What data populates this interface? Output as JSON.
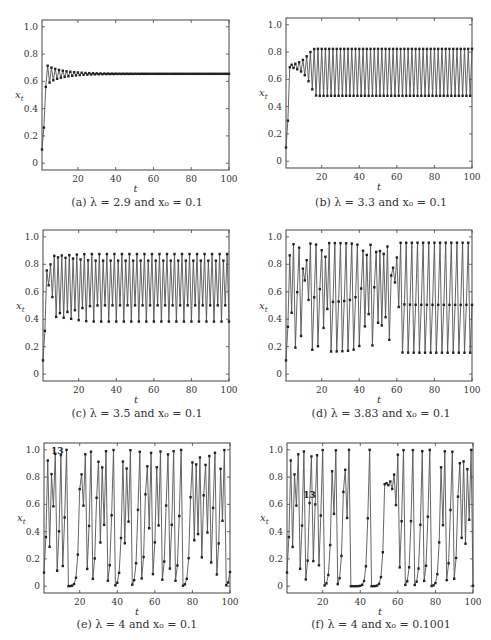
{
  "figure": {
    "panels": [
      {
        "id": "a",
        "caption": "(a) λ = 2.9 and x₀ = 0.1",
        "lambda": 2.9,
        "x0": 0.1,
        "annotation": null
      },
      {
        "id": "b",
        "caption": "(b) λ = 3.3 and x₀ = 0.1",
        "lambda": 3.3,
        "x0": 0.1,
        "annotation": null
      },
      {
        "id": "c",
        "caption": "(c) λ = 3.5 and x₀ = 0.1",
        "lambda": 3.5,
        "x0": 0.1,
        "annotation": null
      },
      {
        "id": "d",
        "caption": "(d) λ = 3.83 and x₀ = 0.1",
        "lambda": 3.83,
        "x0": 0.1,
        "annotation": null
      },
      {
        "id": "e",
        "caption": "(e) λ = 4 and x₀ = 0.1",
        "lambda": 4,
        "x0": 0.1,
        "annotation": {
          "text": "13",
          "t": 13,
          "position": "below-left"
        }
      },
      {
        "id": "f",
        "caption": "(f) λ = 4 and x₀ = 0.1001",
        "lambda": 4,
        "x0": 0.1001,
        "annotation": {
          "text": "13",
          "t": 13,
          "position": "above"
        }
      }
    ],
    "xlabel": "t",
    "ylabel": "x_t",
    "xticks": [
      "20",
      "40",
      "60",
      "80",
      "100"
    ],
    "yticks": [
      "0",
      "0.2",
      "0.4",
      "0.6",
      "0.8",
      "1.0"
    ],
    "line_color": "#555555",
    "marker_color": "#222222"
  },
  "chart_data": [
    {
      "type": "line",
      "title": "(a) λ = 2.9 and x₀ = 0.1",
      "xlabel": "t",
      "ylabel": "x_t",
      "xlim": [
        1,
        100
      ],
      "ylim": [
        -0.05,
        1.05
      ],
      "xticks": [
        20,
        40,
        60,
        80,
        100
      ],
      "yticks": [
        0,
        0.2,
        0.4,
        0.6,
        0.8,
        1.0
      ],
      "grid": false,
      "series": [
        {
          "name": "logistic map λ=2.9, x0=0.1",
          "rule": "x_{t+1} = λ x_t (1 - x_t)",
          "x": [
            1,
            2,
            3,
            4,
            5,
            6,
            7,
            8
          ],
          "values": [
            0.1,
            0.261,
            0.559,
            0.715,
            0.591,
            0.701,
            0.608,
            0.691
          ],
          "steady_state": 0.655
        }
      ]
    },
    {
      "type": "line",
      "title": "(b) λ = 3.3 and x₀ = 0.1",
      "xlabel": "t",
      "ylabel": "x_t",
      "xlim": [
        1,
        100
      ],
      "ylim": [
        -0.05,
        1.05
      ],
      "xticks": [
        20,
        40,
        60,
        80,
        100
      ],
      "yticks": [
        0,
        0.2,
        0.4,
        0.6,
        0.8,
        1.0
      ],
      "grid": false,
      "series": [
        {
          "name": "logistic map λ=3.3, x0=0.1",
          "rule": "x_{t+1} = λ x_t (1 - x_t)",
          "x": [
            1,
            2,
            3,
            4,
            5,
            6
          ],
          "values": [
            0.1,
            0.297,
            0.689,
            0.707,
            0.684,
            0.713
          ],
          "period_2_cycle": [
            0.479,
            0.824
          ]
        }
      ]
    },
    {
      "type": "line",
      "title": "(c) λ = 3.5 and x₀ = 0.1",
      "xlabel": "t",
      "ylabel": "x_t",
      "xlim": [
        1,
        100
      ],
      "ylim": [
        -0.05,
        1.05
      ],
      "xticks": [
        20,
        40,
        60,
        80,
        100
      ],
      "yticks": [
        0,
        0.2,
        0.4,
        0.6,
        0.8,
        1.0
      ],
      "grid": false,
      "series": [
        {
          "name": "logistic map λ=3.5, x0=0.1",
          "rule": "x_{t+1} = λ x_t (1 - x_t)",
          "x": [
            1,
            2,
            3,
            4,
            5,
            6
          ],
          "values": [
            0.1,
            0.315,
            0.755,
            0.647,
            0.799,
            0.562
          ],
          "period_4_cycle": [
            0.383,
            0.827,
            0.501,
            0.875
          ]
        }
      ]
    },
    {
      "type": "line",
      "title": "(d) λ = 3.83 and x₀ = 0.1",
      "xlabel": "t",
      "ylabel": "x_t",
      "xlim": [
        1,
        100
      ],
      "ylim": [
        -0.05,
        1.05
      ],
      "xticks": [
        20,
        40,
        60,
        80,
        100
      ],
      "yticks": [
        0,
        0.2,
        0.4,
        0.6,
        0.8,
        1.0
      ],
      "grid": false,
      "series": [
        {
          "name": "logistic map λ=3.83, x0=0.1",
          "rule": "x_{t+1} = λ x_t (1 - x_t)",
          "x": [
            1,
            2,
            3,
            4,
            5,
            6
          ],
          "values": [
            0.1,
            0.345,
            0.865,
            0.447,
            0.947,
            0.193
          ],
          "period_3_cycle": [
            0.156,
            0.505,
            0.957
          ]
        }
      ]
    },
    {
      "type": "line",
      "title": "(e) λ = 4 and x₀ = 0.1",
      "xlabel": "t",
      "ylabel": "x_t",
      "xlim": [
        1,
        100
      ],
      "ylim": [
        -0.05,
        1.05
      ],
      "xticks": [
        20,
        40,
        60,
        80,
        100
      ],
      "yticks": [
        0,
        0.2,
        0.4,
        0.6,
        0.8,
        1.0
      ],
      "grid": false,
      "annotations": [
        {
          "text": "13",
          "t": 13
        }
      ],
      "series": [
        {
          "name": "logistic map λ=4, x0=0.1",
          "rule": "x_{t+1} = λ x_t (1 - x_t)",
          "x": [
            1,
            2,
            3,
            4,
            5,
            6,
            7,
            8
          ],
          "values": [
            0.1,
            0.36,
            0.922,
            0.289,
            0.822,
            0.585,
            0.971,
            0.113
          ]
        }
      ]
    },
    {
      "type": "line",
      "title": "(f) λ = 4 and x₀ = 0.1001",
      "xlabel": "t",
      "ylabel": "x_t",
      "xlim": [
        1,
        100
      ],
      "ylim": [
        -0.05,
        1.05
      ],
      "xticks": [
        20,
        40,
        60,
        80,
        100
      ],
      "yticks": [
        0,
        0.2,
        0.4,
        0.6,
        0.8,
        1.0
      ],
      "grid": false,
      "annotations": [
        {
          "text": "13",
          "t": 13
        }
      ],
      "series": [
        {
          "name": "logistic map λ=4, x0=0.1001",
          "rule": "x_{t+1} = λ x_t (1 - x_t)",
          "x": [
            1,
            2,
            3,
            4,
            5,
            6,
            7,
            8
          ],
          "values": [
            0.1001,
            0.3604,
            0.9221,
            0.2874,
            0.8191,
            0.5927,
            0.9656,
            0.1328
          ]
        }
      ]
    }
  ]
}
